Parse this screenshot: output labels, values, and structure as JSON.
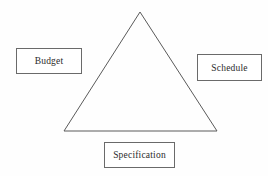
{
  "diagram": {
    "background_color": "#fefefe",
    "shape": {
      "name": "triangle",
      "stroke_color": "#5a5a5a",
      "stroke_width": 1,
      "fill": "none",
      "vertices": {
        "apex": [
          140,
          12
        ],
        "bottom_left": [
          64,
          131
        ],
        "bottom_right": [
          217,
          131
        ]
      }
    },
    "labels": [
      {
        "id": "budget",
        "text": "Budget",
        "position": "left",
        "border_color": "#6a6a6a",
        "text_color": "#2b2b2b"
      },
      {
        "id": "schedule",
        "text": "Schedule",
        "position": "right",
        "border_color": "#6a6a6a",
        "text_color": "#2b2b2b"
      },
      {
        "id": "specification",
        "text": "Specification",
        "position": "bottom",
        "border_color": "#6a6a6a",
        "text_color": "#2b2b2b"
      }
    ]
  }
}
